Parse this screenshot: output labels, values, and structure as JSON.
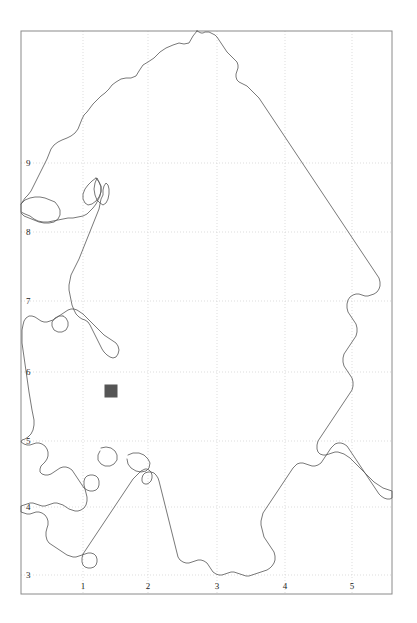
{
  "figure": {
    "type": "map",
    "title": "",
    "width": 417,
    "height": 623,
    "background_color": "#ffffff"
  },
  "frame": {
    "left": 21,
    "top": 31,
    "right": 392,
    "bottom": 594,
    "border_color": "#8a8a8a",
    "border_width": 1
  },
  "grid": {
    "visible": true,
    "style": "dotted",
    "color": "#cfcfcf",
    "x_gridlines": [
      83,
      148,
      217,
      285,
      352
    ],
    "y_gridlines": [
      163,
      232,
      301,
      372,
      441,
      507,
      575
    ]
  },
  "axes": {
    "x_axis": {
      "label": "",
      "ticks": [
        {
          "label": "1",
          "x": 83
        },
        {
          "label": "2",
          "x": 148
        },
        {
          "label": "3",
          "x": 217
        },
        {
          "label": "4",
          "x": 285
        },
        {
          "label": "5",
          "x": 352
        }
      ]
    },
    "y_axis": {
      "label": "",
      "ticks": [
        {
          "label": "9",
          "y": 163
        },
        {
          "label": "8",
          "y": 232
        },
        {
          "label": "7",
          "y": 301
        },
        {
          "label": "6",
          "y": 372
        },
        {
          "label": "5",
          "y": 441
        },
        {
          "label": "4",
          "y": 507
        },
        {
          "label": "3",
          "y": 575
        }
      ]
    }
  },
  "boundary": {
    "name": "region-outline",
    "stroke_color": "#555555",
    "stroke_width": 0.8,
    "fill": "none",
    "path": "M197,31 L193,36 L189,43 L184,44 L179,43 L173,45 L166,48 L160,52 L154,58 L148,62 L143,65 L139,71 L136,76 L131,78 L126,78 L121,79 L116,82 L112,85 L109,89 L105,93 L101,96 L97,100 L93,104 L90,108 L87,112 L84,115 L82,119 L80,124 L78,129 L75,133 L71,136 L67,138 L62,140 L58,142 L54,145 L51,149 L49,154 L47,159 L45,163 L43,167 L41,171 L39,175 L37,179 L35,183 L33,187 L31,191 L28,195 L25,198 L23,201 L21,204 L21,212 L25,214 L30,216 L34,219 L38,221 L43,222 L48,222 L53,221 L58,220 L63,219 L68,218 L73,218 L78,217 L83,216 L87,214 L90,211 L93,208 L96,204 L98,200 L100,196 L101,191 L101,186 L99,182 L97,178 L95,183 L94,189 L95,195 L97,200 L100,203 L103,205 L106,203 L108,199 L109,194 L109,189 L108,185 L106,183 L104,186 L103,190 L103,195 L101,199 L100,204 L99,209 L97,214 L95,219 L93,224 L91,229 L89,234 L87,239 L85,244 L83,249 L81,254 L79,259 L77,263 L75,267 L73,271 L71,275 L70,280 L69,285 L69,290 L70,295 L71,300 L72,305 L74,310 L76,314 L79,317 L82,319 L85,320 L88,322 L90,325 L92,329 L94,333 L96,337 L98,341 L100,345 L102,349 L104,352 L107,355 L110,357 L113,358 L116,357 L118,354 L119,350 L118,346 L116,343 L113,341 L110,339 L107,337 L104,335 L101,332 L98,329 L95,326 L92,323 L89,320 L86,317 L83,314 L80,312 L77,310 L74,309 L71,309 L68,310 L65,312 L62,314 L59,316 L56,318 L53,320 L50,321 L47,322 L44,322 L41,321 L38,319 L35,317 L32,316 L29,316 L26,318 L24,321 L23,325 L22,330 L22,336 L22,343 L23,350 L24,357 L25,364 L26,371 L27,378 L28,385 L29,392 L30,398 L31,404 L32,410 L33,415 L34,420 L34,425 L33,430 L31,434 L28,437 L25,439 L22,440 L21,442 L24,444 L27,445 L30,445 L33,444 L36,443 L39,443 L42,444 L45,446 L47,449 L48,452 L48,456 L47,459 L45,462 L43,464 L41,466 L40,469 L40,472 L42,474 L45,475 L48,475 L51,474 L54,472 L57,470 L60,468 L63,467 L66,467 L69,468 L72,470 L74,473 L76,476 L78,479 L80,482 L82,485 L84,488 L87,490 L90,491 L93,491 L96,490 L98,488 L99,485 L99,481 L98,478 L96,476 L93,475 L90,475 L87,476 L85,478 L84,481 L84,485 L85,489 L86,493 L87,497 L87,501 L86,505 L84,508 L81,510 L78,511 L75,511 L72,510 L69,509 L66,507 L63,505 L60,504 L57,503 L54,503 L51,504 L48,505 L45,506 L42,506 L39,505 L36,504 L33,503 L30,503 L27,504 L24,505 L21,506 L21,512 L24,513 L27,514 L30,514 L33,513 L36,512 L39,512 L42,513 L45,515 L47,518 L48,521 L48,525 L47,528 L46,532 L46,536 L47,540 L49,543 L52,545 L55,547 L58,549 L61,551 L64,553 L67,555 L70,556 L73,557 L76,557 L79,556 L82,555 L85,554 L88,553 L91,553 L94,554 L96,556 L97,559 L97,562 L96,565 L94,567 L91,568 L88,568 L85,567 L83,565 L82,562 L82,558 L83,554 L85,551 L87,548 L89,545 L91,542 L93,539 L95,536 L97,533 L99,530 L101,527 L103,524 L105,521 L107,518 L109,515 L111,512 L113,509 L115,506 L117,503 L119,500 L121,497 L123,494 L125,491 L127,488 L129,485 L131,482 L133,479 L135,477 L137,475 L139,473 L141,471 L143,470 L145,469 L147,469 L149,470 L151,472 L152,475 L152,478 L151,481 L149,483 L147,484 L145,484 L143,483 L142,481 L142,478 L143,475 L145,473 L148,472 L151,472 L154,473 L156,475 L158,478 L159,481 L160,485 L161,489 L162,493 L163,497 L164,501 L165,505 L166,509 L167,513 L168,517 L169,521 L170,525 L171,529 L172,533 L173,537 L174,541 L175,545 L176,549 L177,553 L178,557 L180,560 L183,562 L186,563 L189,563 L192,562 L195,561 L198,560 L201,560 L204,561 L207,563 L209,566 L211,569 L213,572 L216,574 L219,575 L222,575 L225,574 L228,573 L231,572 L234,572 L237,573 L240,574 L243,575 L246,576 L249,576 L252,575 L255,574 L258,573 L261,572 L264,571 L267,570 L270,568 L272,566 L274,563 L275,560 L275,556 L274,552 L272,549 L270,546 L268,543 L266,540 L264,537 L263,533 L262,529 L261,525 L261,521 L262,517 L263,513 L265,510 L267,507 L269,504 L271,501 L273,498 L275,495 L277,492 L279,489 L281,486 L283,483 L285,480 L287,477 L289,474 L291,471 L293,468 L295,466 L297,464 L300,463 L303,463 L306,464 L309,465 L312,466 L315,466 L318,465 L321,463 L323,460 L325,457 L327,454 L329,451 L331,448 L333,446 L335,444 L338,443 L341,443 L344,444 L347,446 L349,449 L351,452 L353,455 L355,458 L357,461 L359,464 L361,467 L363,470 L365,473 L367,476 L369,479 L371,482 L373,485 L375,488 L377,491 L379,494 L381,496 L384,498 L387,499 L390,499 L392,498 L392,491 L389,490 L386,489 L383,488 L380,486 L377,484 L374,482 L371,479 L368,476 L365,473 L362,470 L359,467 L356,464 L353,461 L350,458 L347,456 L344,454 L341,453 L338,452 L335,452 L332,453 L329,454 L326,455 L323,455 L320,454 L318,452 L317,449 L317,445 L318,441 L320,438 L322,435 L324,432 L326,429 L328,426 L330,423 L332,420 L334,417 L336,414 L338,411 L340,408 L342,405 L344,402 L346,399 L348,396 L350,393 L352,390 L353,386 L353,382 L352,378 L350,375 L348,372 L346,369 L344,366 L343,362 L343,358 L344,354 L346,351 L348,348 L350,345 L352,342 L354,339 L356,336 L357,332 L357,328 L356,324 L354,321 L352,318 L350,315 L348,312 L347,308 L347,304 L348,300 L350,297 L353,295 L356,294 L359,294 L362,295 L365,296 L368,296 L371,295 L374,294 L377,292 L379,289 L380,286 L380,282 L379,278 L377,275 L375,272 L373,269 L371,266 L369,263 L367,260 L365,257 L363,254 L361,251 L359,248 L357,245 L355,242 L353,239 L351,236 L349,233 L347,230 L345,227 L343,224 L341,221 L339,218 L337,215 L335,212 L333,209 L331,206 L329,203 L327,200 L325,197 L323,194 L321,191 L319,188 L317,185 L315,182 L313,179 L311,176 L309,173 L307,170 L305,167 L303,164 L301,161 L299,158 L297,155 L295,152 L293,149 L291,146 L289,143 L287,140 L285,137 L283,134 L281,131 L279,128 L277,125 L275,122 L273,119 L271,116 L269,113 L267,110 L265,107 L263,104 L261,101 L259,98 L257,96 L255,94 L253,92 L251,90 L249,88 L247,86 L245,85 L243,84 L241,83 L239,82 L237,80 L236,77 L236,74 L237,71 L238,68 L238,65 L237,62 L235,60 L233,58 L231,56 L229,54 L227,52 L225,49 L223,46 L221,43 L219,40 L217,37 L215,35 L213,34 L211,33 L209,32 L207,32 L205,32 L203,33 L201,33 L199,32 L197,31 Z"
  },
  "coast_detail": {
    "name": "inner-coastline-detail",
    "stroke_color": "#555555",
    "stroke_width": 0.8,
    "paths": [
      "M21,204 L25,200 L30,198 L35,197 L40,197 L45,198 L50,200 L55,202 L58,206 L60,210 L60,215 L58,219 L54,222 L49,223 L44,223 L39,222 L34,220 L29,218 L24,216 L21,213",
      "M96,178 L99,182 L101,187 L101,192 L99,197 L96,201 L92,204 L88,205 L85,203 L83,199 L83,194 L85,189 L88,185 L92,181 L96,178",
      "M63,316 L66,318 L68,322 L68,326 L66,330 L62,332 L58,332 L54,330 L52,326 L52,322 L55,318 L59,316 L63,316",
      "M101,448 L106,447 L111,448 L115,451 L117,455 L117,460 L114,464 L110,466 L105,466 L101,464 L98,460 L98,455 L100,451",
      "M128,455 L133,453 L139,453 L144,455 L148,459 L150,463 L149,468 L146,471 L141,472 L136,471 L131,468 L128,464 L127,459"
    ]
  },
  "markers": [
    {
      "name": "location-marker",
      "shape": "square",
      "x": 111,
      "y": 391,
      "size": 13,
      "fill_color": "#555555",
      "label": ""
    }
  ]
}
